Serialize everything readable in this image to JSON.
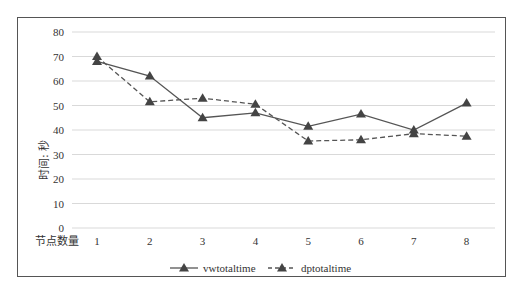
{
  "chart_data": {
    "type": "line",
    "title": "",
    "xlabel": "节点数量",
    "ylabel": "时间: 秒",
    "x": [
      1,
      2,
      3,
      4,
      5,
      6,
      7,
      8
    ],
    "categories": [
      "1",
      "2",
      "3",
      "4",
      "5",
      "6",
      "7",
      "8"
    ],
    "ylim": [
      0,
      80
    ],
    "yticks": [
      0,
      10,
      20,
      30,
      40,
      50,
      60,
      70,
      80
    ],
    "grid": true,
    "legend_position": "bottom",
    "series": [
      {
        "name": "vwtotaltime",
        "style": "solid",
        "marker": "triangle",
        "color": "#555555",
        "values": [
          68,
          62,
          45,
          47,
          41.5,
          46.5,
          40,
          51
        ]
      },
      {
        "name": "dptotaltime",
        "style": "dashed",
        "marker": "triangle",
        "color": "#555555",
        "values": [
          70,
          51.5,
          53,
          50.5,
          35.5,
          36,
          38.5,
          37.5
        ]
      }
    ]
  },
  "axis": {
    "ylabel": "时间: 秒",
    "xlabel": "节点数量"
  },
  "legend": {
    "items": [
      "vwtotaltime",
      "dptotaltime"
    ]
  }
}
